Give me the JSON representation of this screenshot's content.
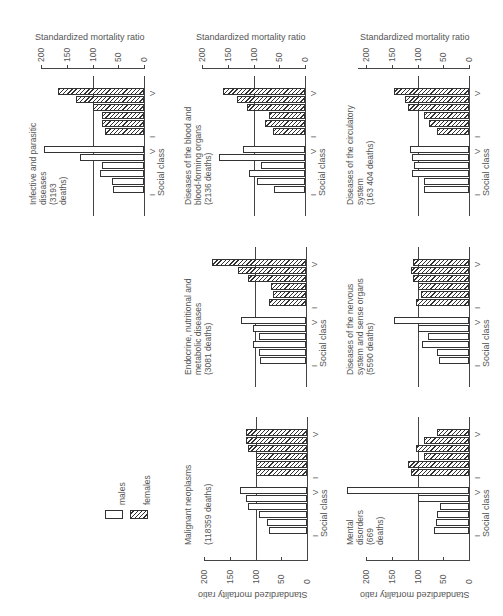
{
  "figure": {
    "axis_label": "Standardized mortality ratio",
    "category_label": "Social class",
    "class_first": "I",
    "class_last": "V",
    "ticks": [
      "0",
      "50",
      "100",
      "150",
      "200"
    ],
    "legend": {
      "males": "males",
      "females": "females"
    }
  },
  "chart_data": {
    "type": "bar",
    "orientation": "rotated 90 degrees (horizontal bars in page, vertical in reading orientation)",
    "categories": [
      "I",
      "II",
      "IIIN",
      "IIIM",
      "IV",
      "V"
    ],
    "ylabel": "Standardized mortality ratio",
    "xlabel": "Social class",
    "ylim": [
      0,
      200
    ],
    "reference_line": 100,
    "legend": [
      "males",
      "females"
    ],
    "panels": [
      {
        "title": "Infective and parasitic diseases (3193 deaths)",
        "series": [
          {
            "name": "males",
            "values": [
              61,
              63,
              86,
              82,
              124,
              194
            ]
          },
          {
            "name": "females",
            "values": [
              76,
              82,
              82,
              100,
              133,
              167
            ]
          }
        ]
      },
      {
        "title": "Diseases of the blood and blood-forming organs (2136 deaths)",
        "series": [
          {
            "name": "males",
            "values": [
              60,
              93,
              109,
              86,
              167,
              120
            ]
          },
          {
            "name": "females",
            "values": [
              62,
              78,
              70,
              113,
              132,
              159
            ]
          }
        ]
      },
      {
        "title": "Diseases of the circulatory system (163 404 deaths)",
        "series": [
          {
            "name": "males",
            "values": [
              87,
              88,
              110,
              106,
              110,
              115
            ]
          },
          {
            "name": "females",
            "values": [
              62,
              77,
              87,
              119,
              125,
              146
            ]
          }
        ]
      },
      {
        "title": "Endocrine, nutritional and metabolic diseases (3081 deaths)",
        "series": [
          {
            "name": "males",
            "values": [
              89,
              91,
              102,
              92,
              102,
              126
            ]
          },
          {
            "name": "females",
            "values": [
              72,
              64,
              68,
              113,
              132,
              183
            ]
          }
        ]
      },
      {
        "title": "Diseases of the nervous system and sense organs (5590 deaths)",
        "series": [
          {
            "name": "males",
            "values": [
              58,
              62,
              92,
              79,
              100,
              146
            ]
          },
          {
            "name": "females",
            "values": [
              102,
              94,
              100,
              108,
              112,
              108
            ]
          }
        ]
      },
      {
        "title": "Malignant neoplasms (118359 deaths)",
        "series": [
          {
            "name": "males",
            "values": [
              74,
              78,
              94,
              114,
              118,
              131
            ]
          },
          {
            "name": "females",
            "values": [
              100,
              100,
              100,
              115,
              118,
              118
            ]
          }
        ]
      },
      {
        "title": "Mental disorders (669 deaths)",
        "series": [
          {
            "name": "males",
            "values": [
              67,
              65,
              63,
              56,
              100,
              237
            ]
          },
          {
            "name": "females",
            "values": [
              112,
              119,
              88,
              102,
              88,
              63
            ]
          }
        ]
      }
    ]
  },
  "panels": {
    "infective": {
      "title": "Infective and parasitic\ndiseases\n(3193\ndeaths)"
    },
    "blood": {
      "title": "Diseases of the blood and\nblood-forming organs\n(2136 deaths)"
    },
    "circulatory": {
      "title": "Diseases of the circulatory\nsystem\n(163 404 deaths)"
    },
    "endocrine": {
      "title": "Endocrine, nutritional and\nmetabolic diseases\n(3081 deaths)"
    },
    "nervous": {
      "title": "Diseases of the nervous\nsystem and sense organs\n(5590 deaths)"
    },
    "malignant": {
      "title": "Malignant neoplasms\n\n(118359 deaths)"
    },
    "mental": {
      "title": "Mental\ndisorders\n(669\ndeaths)"
    }
  }
}
